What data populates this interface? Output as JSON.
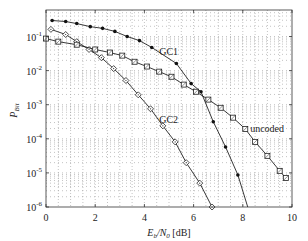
{
  "chart_data": {
    "type": "line",
    "title": "",
    "xlabel": "E_b/N_0 [dB]",
    "xlabel_parts": {
      "main": "E",
      "sub1": "b",
      "slash": "/N",
      "sub2": "0",
      "unit": " [dB]"
    },
    "ylabel": "P_Bit",
    "ylabel_parts": {
      "main": "P",
      "sub": "Bit"
    },
    "xlim": [
      0,
      10
    ],
    "ylim": [
      1e-06,
      0.6
    ],
    "yscale": "log",
    "grid": true,
    "x_ticks": [
      0,
      2,
      4,
      6,
      8,
      10
    ],
    "x_tick_labels": [
      "0",
      "2",
      "4",
      "6",
      "8",
      "10"
    ],
    "y_ticks": [
      0.1,
      0.01,
      0.001,
      0.0001,
      1e-05,
      1e-06
    ],
    "y_tick_labels": [
      {
        "base": "10",
        "exp": "-1"
      },
      {
        "base": "10",
        "exp": "-2"
      },
      {
        "base": "10",
        "exp": "-3"
      },
      {
        "base": "10",
        "exp": "-4"
      },
      {
        "base": "10",
        "exp": "-5"
      },
      {
        "base": "10",
        "exp": "-6"
      }
    ],
    "series": [
      {
        "name": "GC1",
        "marker": "filled-circle",
        "label": "GC1",
        "label_at": [
          4.6,
          -1.55
        ],
        "x": [
          0.25,
          0.8,
          1.25,
          1.8,
          2.3,
          2.8,
          3.3,
          3.8,
          4.3,
          5.3,
          5.9,
          6.3,
          6.8,
          7.3,
          7.8,
          8.2
        ],
        "log10_y": [
          -0.53,
          -0.56,
          -0.62,
          -0.71,
          -0.76,
          -0.85,
          -1.0,
          -1.12,
          -1.32,
          -1.79,
          -2.38,
          -2.62,
          -3.5,
          -4.24,
          -5.06,
          -6.0
        ],
        "marker_count": 15
      },
      {
        "name": "GC2",
        "marker": "diamond",
        "label": "GC2",
        "label_at": [
          4.6,
          -3.55
        ],
        "x": [
          0.2,
          0.8,
          1.25,
          1.75,
          2.25,
          2.75,
          3.25,
          3.75,
          4.25,
          4.75,
          5.25,
          5.7,
          6.25,
          6.75
        ],
        "log10_y": [
          -0.79,
          -0.94,
          -1.15,
          -1.38,
          -1.62,
          -1.94,
          -2.29,
          -2.71,
          -3.12,
          -3.62,
          -4.09,
          -4.7,
          -5.3,
          -6.0
        ],
        "marker_count": 14
      },
      {
        "name": "uncoded",
        "marker": "square",
        "label": "uncoded",
        "label_at": [
          8.3,
          -3.8
        ],
        "x": [
          0,
          0.5,
          1.25,
          2.0,
          2.6,
          3.1,
          3.6,
          4.1,
          4.6,
          5.1,
          5.6,
          6.1,
          6.6,
          7.1,
          7.6,
          8.1,
          8.5,
          9.0,
          9.5,
          9.75
        ],
        "log10_y": [
          -1.06,
          -1.15,
          -1.24,
          -1.38,
          -1.47,
          -1.56,
          -1.74,
          -1.88,
          -2.03,
          -2.18,
          -2.41,
          -2.62,
          -2.85,
          -3.09,
          -3.38,
          -3.71,
          -4.09,
          -4.5,
          -4.94,
          -5.15
        ],
        "marker_count": 20
      }
    ]
  }
}
